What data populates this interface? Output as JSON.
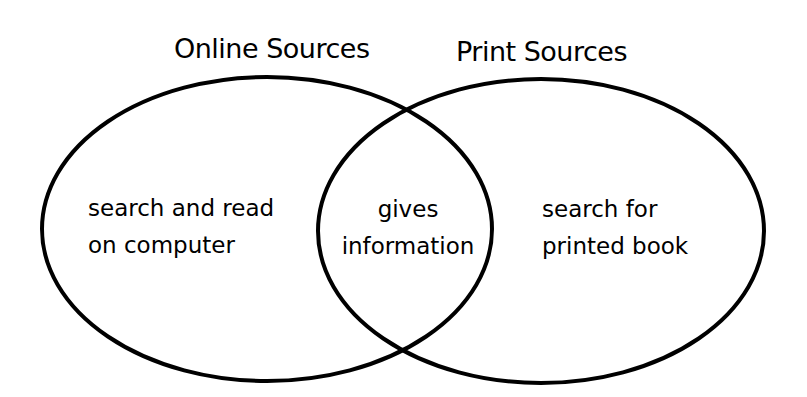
{
  "diagram": {
    "type": "venn",
    "stroke_color": "#000000",
    "background_color": "#ffffff",
    "sets": [
      {
        "id": "online",
        "title": "Online Sources",
        "unique_lines": [
          "search and read",
          "on computer"
        ]
      },
      {
        "id": "print",
        "title": "Print Sources",
        "unique_lines": [
          "search for",
          "printed book"
        ]
      }
    ],
    "overlap": {
      "lines": [
        "gives",
        "information"
      ]
    }
  }
}
